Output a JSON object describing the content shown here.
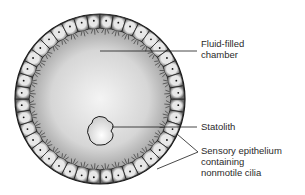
{
  "figure": {
    "colors": {
      "background": "#ffffff",
      "chamber_center": "#f2f2f2",
      "chamber_edge": "#9a9a9a",
      "cell_fill_light": "#e6e6e6",
      "cell_fill_dark": "#7a7a7a",
      "outline": "#1a1a1a",
      "label_text": "#2a2a2a"
    },
    "geometry": {
      "center": [
        100,
        99
      ],
      "outer_radius": 85,
      "inner_radius": 72,
      "cell_count": 40,
      "statolith_center": [
        101,
        131
      ]
    }
  },
  "labels": [
    {
      "id": "fluid-filled-chamber",
      "lines": [
        "Fluid-filled",
        "chamber"
      ],
      "x": 201,
      "y": 38,
      "leader": [
        [
          100,
          51
        ],
        [
          197,
          51
        ]
      ]
    },
    {
      "id": "statolith",
      "lines": [
        "Statolith"
      ],
      "x": 201,
      "y": 121,
      "leader": [
        [
          112,
          127
        ],
        [
          197,
          127
        ]
      ]
    },
    {
      "id": "sensory-epithelium",
      "lines": [
        "Sensory epithelium",
        "containing",
        "nonmotile cilia"
      ],
      "x": 201,
      "y": 145,
      "leader": [
        [
          177,
          134
        ],
        [
          198,
          152
        ],
        [
          157,
          169
        ]
      ]
    }
  ]
}
